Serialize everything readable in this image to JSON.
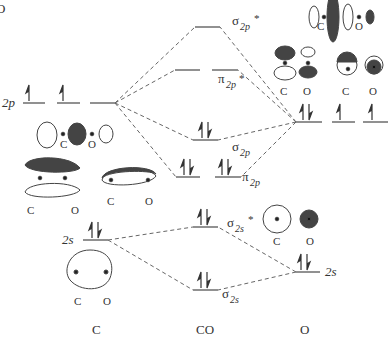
{
  "columns": {
    "left": "C",
    "middle": "CO",
    "right": "O"
  },
  "atomic_levels": {
    "C_2p": {
      "label": "2p",
      "electrons": 2
    },
    "C_2s": {
      "label": "2s",
      "electrons": 2
    },
    "O_2p": {
      "label": "2s",
      "electrons": 4
    },
    "O_2s": {
      "label": "2s",
      "electrons": 2
    }
  },
  "labels": {
    "c2p": "2p",
    "c2s": "2s",
    "o2s": "2s",
    "sigma": "σ",
    "pi": "π",
    "sub_2p": "2p",
    "sub_2s": "2s",
    "star": "*"
  },
  "mo_levels": [
    {
      "name": "σ2p*",
      "electrons": 0
    },
    {
      "name": "π2p*",
      "electrons": 0,
      "degenerate": 2
    },
    {
      "name": "σ2p",
      "electrons": 2
    },
    {
      "name": "π2p",
      "electrons": 4,
      "degenerate": 2
    },
    {
      "name": "σ2s*",
      "electrons": 2
    },
    {
      "name": "σ2s",
      "electrons": 2
    }
  ],
  "orbital_sketch_labels": {
    "c": "C",
    "o": "O"
  },
  "colors": {
    "line": "#555555",
    "dash": "#666666",
    "fill_dark": "#444444",
    "text": "#333333"
  }
}
